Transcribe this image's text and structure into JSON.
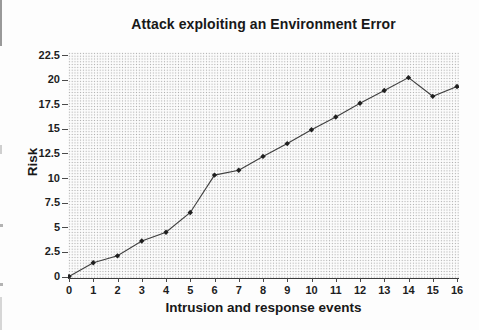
{
  "figure": {
    "title": "Attack exploiting an Environment Error"
  },
  "chart_data": {
    "type": "line",
    "title": "Attack exploiting an Environment Error",
    "xlabel": "Intrusion and response events",
    "ylabel": "Risk",
    "x": [
      0,
      1,
      2,
      3,
      4,
      5,
      6,
      7,
      8,
      9,
      10,
      11,
      12,
      13,
      14,
      15,
      16
    ],
    "y": [
      0,
      1.4,
      2.1,
      3.6,
      4.5,
      6.5,
      10.3,
      10.8,
      12.2,
      13.5,
      14.9,
      16.2,
      17.6,
      18.9,
      20.2,
      18.3,
      19.3
    ],
    "xlim": [
      0,
      16
    ],
    "ylim": [
      0,
      22.5
    ],
    "x_tick_values": [
      0,
      1,
      2,
      3,
      4,
      5,
      6,
      7,
      8,
      9,
      10,
      11,
      12,
      13,
      14,
      15,
      16
    ],
    "x_tick_labels": [
      "0",
      "1",
      "2",
      "3",
      "4",
      "5",
      "6",
      "7",
      "8",
      "9",
      "10",
      "11",
      "12",
      "13",
      "14",
      "15",
      "16"
    ],
    "y_tick_values": [
      0,
      2.5,
      5,
      7.5,
      10,
      12.5,
      15,
      17.5,
      20,
      22.5
    ],
    "y_tick_labels": [
      "0",
      "2.5",
      "5",
      "7.5",
      "10",
      "12.5",
      "15",
      "17.5",
      "20",
      "22.5"
    ],
    "grid": false,
    "legend": "none",
    "marker": "diamond",
    "plot_background": "light-gray halftone dot texture",
    "colors": {
      "line": "#3f3f3f",
      "marker": "#202020",
      "text": "#181818",
      "axis": "#3b3b3b",
      "halftone_dot": "#a9a9a9",
      "page_background": "#fdfdfd"
    }
  }
}
